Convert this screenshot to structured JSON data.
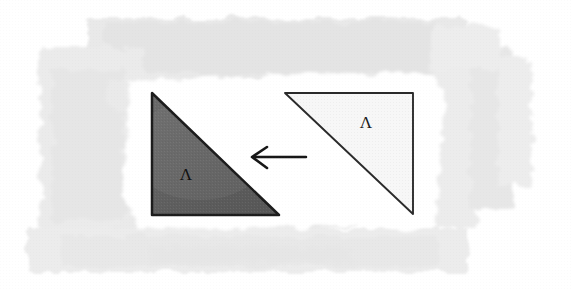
{
  "figure": {
    "kind": "hand-drawn-geometry-diagram",
    "background": {
      "paper_color": "#ffffff",
      "wash_color": "#e8e8e8",
      "wash_color_light": "#efefef",
      "wash_color_deep": "#e0e0e0",
      "halo_color": "#ffffff"
    },
    "shapes": [
      {
        "name": "filled-triangle",
        "role": "result",
        "label": "Λ",
        "label_name": "lambda",
        "fill": "#5f5f5f",
        "stroke": "#1c1c1c",
        "stroke_width": 2.4,
        "points": "152,93 152,215 279,215",
        "label_x": 186,
        "label_y": 180
      },
      {
        "name": "outline-triangle",
        "role": "source",
        "label": "Λ",
        "label_name": "lambda",
        "fill": "#f6f6f6",
        "stroke": "#2a2a2a",
        "stroke_width": 1.8,
        "points": "285,93 413,93 413,214",
        "label_x": 366,
        "label_y": 128
      }
    ],
    "arrow": {
      "name": "leftward-arrow",
      "direction": "left",
      "color": "#161616",
      "stroke_width": 2.6,
      "tail_x": 306,
      "tail_y": 157,
      "head_x": 252,
      "head_y": 157,
      "head_upper": "266,147",
      "head_lower": "266,168"
    }
  }
}
